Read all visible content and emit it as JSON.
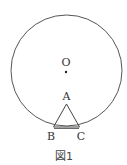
{
  "diagram": {
    "caption": "図1",
    "circle": {
      "cx": 66.5,
      "cy": 70.5,
      "r": 55.5,
      "stroke": "#555555"
    },
    "points": {
      "O": {
        "label": "O",
        "x": 66,
        "y": 72
      },
      "A": {
        "label": "A",
        "x": 66.5,
        "y": 104
      },
      "B": {
        "label": "B",
        "x": 53.5,
        "y": 127
      },
      "C": {
        "label": "C",
        "x": 79.5,
        "y": 127
      }
    },
    "triangle": [
      "A",
      "B",
      "C"
    ]
  }
}
